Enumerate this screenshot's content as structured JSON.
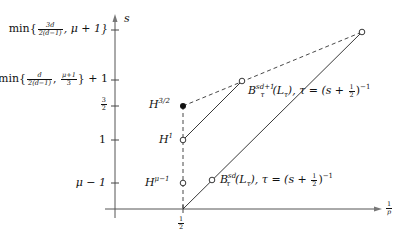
{
  "axes": {
    "x_label": {
      "num": "1",
      "den": "p"
    },
    "y_label": "s",
    "x_ticks": [
      {
        "num": "1",
        "den": "2"
      }
    ]
  },
  "y_ticks": {
    "top": {
      "prefix": "min{",
      "f1_num": "3d",
      "f1_den": "2(d−1)",
      "rest": ", μ + 1}"
    },
    "upper": {
      "prefix": "min{",
      "f1_num": "d",
      "f1_den": "2(d−1)",
      "sep": ", ",
      "f2_num": "μ+1",
      "f2_den": "3",
      "rest": "} + 1"
    },
    "three_halves": {
      "num": "3",
      "den": "2"
    },
    "one": "1",
    "mu_minus_one": "μ − 1"
  },
  "points": {
    "h32": {
      "base": "H",
      "sup": "3/2"
    },
    "h1": {
      "base": "H",
      "sup": "1"
    },
    "hmu": {
      "base": "H",
      "sup": "μ−1"
    }
  },
  "curves": {
    "upper": {
      "base": "B",
      "sup": "sd+1",
      "sub": "τ",
      "arg": "(L",
      "argsub": "τ",
      "tail": "),  τ = (s + ",
      "half_num": "1",
      "half_den": "2",
      "end": ")",
      "exp": "−1"
    },
    "lower": {
      "base": "B",
      "sup": "sd",
      "sub": "τ",
      "arg": "(L",
      "argsub": "τ",
      "tail": "),  τ = (s + ",
      "half_num": "1",
      "half_den": "2",
      "end": ")",
      "exp": "−1"
    }
  }
}
